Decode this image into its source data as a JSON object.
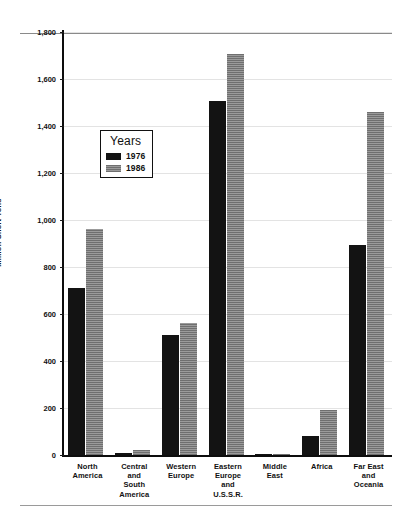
{
  "chart_data": {
    "type": "bar",
    "title": "",
    "subtitle": "",
    "xlabel": "",
    "ylabel": "Million Short Tons",
    "ylim": [
      0,
      1800
    ],
    "yticks": [
      "0",
      "200",
      "400",
      "600",
      "800",
      "1,000",
      "1,200",
      "1,400",
      "1,600",
      "1,800"
    ],
    "ytick_values": [
      0,
      200,
      400,
      600,
      800,
      1000,
      1200,
      1400,
      1600,
      1800
    ],
    "grid": "horizontal",
    "legend_position": "inside-upper-left",
    "legend_title": "Years",
    "categories": [
      "North America",
      "Central and South America",
      "Western Europe",
      "Eastern Europe and U.S.S.R.",
      "Middle East",
      "Africa",
      "Far East and Oceania"
    ],
    "category_lines": [
      [
        "North",
        "America"
      ],
      [
        "Central",
        "and",
        "South",
        "America"
      ],
      [
        "Western",
        "Europe"
      ],
      [
        "Eastern",
        "Europe",
        "and",
        "U.S.S.R."
      ],
      [
        "Middle",
        "East"
      ],
      [
        "Africa"
      ],
      [
        "Far East",
        "and",
        "Oceania"
      ]
    ],
    "series": [
      {
        "name": "1976",
        "color": "#131313",
        "values": [
          710,
          8,
          510,
          1505,
          2,
          80,
          895
        ]
      },
      {
        "name": "1986",
        "color": "#8a8a8a",
        "values": [
          960,
          20,
          560,
          1705,
          5,
          190,
          1460
        ]
      }
    ]
  },
  "figure": {
    "top_rule": "",
    "bottom_rule": ""
  }
}
